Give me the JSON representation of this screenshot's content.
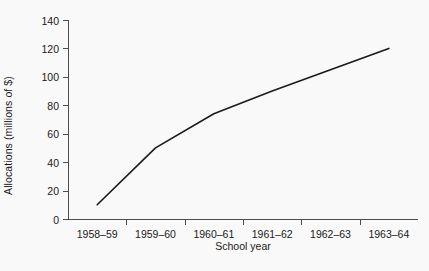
{
  "chart_data": {
    "type": "line",
    "title": "",
    "xlabel": "School year",
    "ylabel": "Allocations (millions of $)",
    "categories": [
      "1958–59",
      "1959–60",
      "1960–61",
      "1961–62",
      "1962–63",
      "1963–64"
    ],
    "values": [
      10,
      50,
      74,
      90,
      105,
      120
    ],
    "series": [
      {
        "name": "Allocations",
        "values": [
          10,
          50,
          74,
          90,
          105,
          120
        ]
      }
    ],
    "ylim": [
      0,
      140
    ],
    "yticks": [
      0,
      20,
      40,
      60,
      80,
      100,
      120,
      140
    ],
    "ytick_labels": [
      "0",
      "20",
      "40",
      "60",
      "80",
      "100",
      "120",
      "140"
    ],
    "grid": false,
    "legend": false,
    "legend_position": "none",
    "line_color": "#1a1a1a",
    "background_color": "#f9f9f9",
    "axis_color": "#4d4d4d"
  }
}
